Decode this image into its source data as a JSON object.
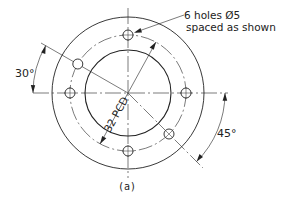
{
  "figure": {
    "caption": "(a)",
    "note_line1": "6 holes Ø5",
    "note_line2": "spaced as shown",
    "pcd_label": "32 PCD",
    "angle_left_label": "30°",
    "angle_right_label": "45°"
  },
  "geometry": {
    "center": [
      128,
      93
    ],
    "outer_radius": 76,
    "pcd_radius": 58,
    "inner_radius": 43,
    "hole_radius": 5,
    "hole_count": 6,
    "hole_angles_deg": [
      90,
      150,
      180,
      0,
      270,
      315
    ],
    "pcd_diameter_angle_deg": 61,
    "left_angle_deg": 30,
    "right_angle_deg": 45
  },
  "colors": {
    "line": "#222222",
    "background": "#ffffff"
  }
}
